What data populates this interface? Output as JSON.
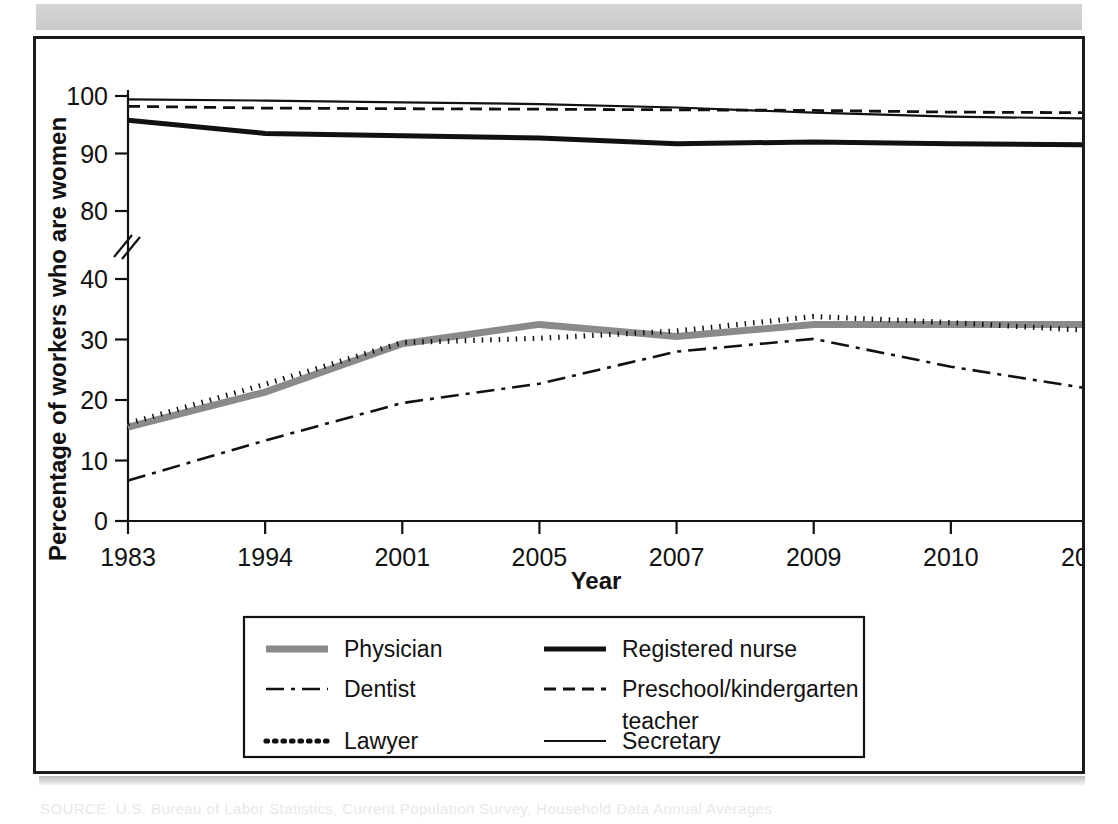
{
  "figure": {
    "caption_ghost": "SOURCE: U.S. Bureau of Labor Statistics, Current Population Survey, Household Data Annual Averages"
  },
  "chart_data": {
    "type": "line",
    "title": "",
    "xlabel": "Year",
    "ylabel": "Percentage of workers who are women",
    "categories": [
      "1983",
      "1994",
      "2001",
      "2005",
      "2007",
      "2009",
      "2010",
      "2011"
    ],
    "grid": false,
    "legend_position": "bottom",
    "axis_break": {
      "between": [
        40,
        80
      ],
      "note": "y-axis broken between 40 and 80"
    },
    "yticks": [
      0,
      10,
      20,
      30,
      40,
      80,
      90,
      100
    ],
    "ylim": [
      0,
      100
    ],
    "series": [
      {
        "name": "Physician",
        "style": "solid-thick-gray",
        "color": "#8a8a8a",
        "width": 7,
        "dash": "none",
        "values": [
          15.5,
          21.3,
          29.3,
          32.5,
          30.5,
          32.5,
          32.5,
          32.5
        ]
      },
      {
        "name": "Registered nurse",
        "style": "solid-thick-black",
        "color": "#111111",
        "width": 5,
        "dash": "none",
        "values": [
          95.8,
          93.5,
          93.1,
          92.7,
          91.7,
          92.0,
          91.7,
          91.5
        ]
      },
      {
        "name": "Dentist",
        "style": "dash-dot",
        "color": "#111111",
        "width": 2.6,
        "dash": "18,7,4,7",
        "values": [
          6.7,
          13.3,
          19.5,
          22.7,
          28.0,
          30.1,
          25.5,
          21.9
        ]
      },
      {
        "name": "Preschool/kindergarten teacher",
        "style": "dashed",
        "color": "#111111",
        "width": 2.8,
        "dash": "12,7",
        "values": [
          98.2,
          97.9,
          97.8,
          97.7,
          97.6,
          97.5,
          97.2,
          97.1
        ]
      },
      {
        "name": "Lawyer",
        "style": "dotted",
        "color": "#111111",
        "width": 5.2,
        "dash": "1.5,7",
        "values": [
          16.1,
          22.6,
          29.5,
          30.2,
          31.4,
          33.8,
          32.8,
          31.5
        ]
      },
      {
        "name": "Secretary",
        "style": "solid-thin",
        "color": "#111111",
        "width": 2.2,
        "dash": "none",
        "values": [
          99.4,
          99.2,
          98.9,
          98.6,
          98.0,
          97.1,
          96.4,
          96.1
        ]
      }
    ],
    "legend": [
      {
        "label": "Physician",
        "series": "Physician"
      },
      {
        "label": "Registered nurse",
        "series": "Registered nurse"
      },
      {
        "label": "Dentist",
        "series": "Dentist"
      },
      {
        "label": "Preschool/kindergarten",
        "series": "Preschool/kindergarten teacher"
      },
      {
        "label": "teacher",
        "series": "Preschool/kindergarten teacher"
      },
      {
        "label": "Lawyer",
        "series": "Lawyer"
      },
      {
        "label": "Secretary",
        "series": "Secretary"
      }
    ]
  }
}
